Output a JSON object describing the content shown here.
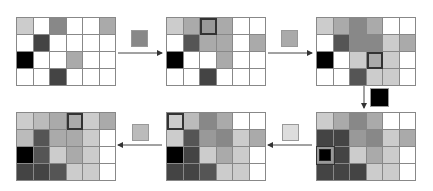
{
  "palette": {
    "W": "#ffffff",
    "L1": "#dddddd",
    "L2": "#cccccc",
    "L3": "#bbbbbb",
    "M1": "#aaaaaa",
    "M2": "#999999",
    "M3": "#888888",
    "D1": "#555555",
    "D2": "#444444",
    "K": "#000000"
  },
  "grids": [
    {
      "id": "g1",
      "cells": [
        [
          "L2",
          "W",
          "M3",
          "W",
          "W",
          "M1"
        ],
        [
          "W",
          "D2",
          "W",
          "W",
          "W",
          "W"
        ],
        [
          "K",
          "W",
          "W",
          "M1",
          "W",
          "W"
        ],
        [
          "W",
          "W",
          "D2",
          "W",
          "W",
          "W"
        ]
      ],
      "highlight": null
    },
    {
      "id": "g2",
      "cells": [
        [
          "L2",
          "M1",
          "M2",
          "M1",
          "W",
          "W"
        ],
        [
          "W",
          "D1",
          "M1",
          "M1",
          "W",
          "M1"
        ],
        [
          "K",
          "W",
          "W",
          "M1",
          "W",
          "W"
        ],
        [
          "W",
          "W",
          "D2",
          "W",
          "W",
          "W"
        ]
      ],
      "highlight": {
        "row": 0,
        "col": 2,
        "style": "dark"
      }
    },
    {
      "id": "g3",
      "cells": [
        [
          "L2",
          "M1",
          "M3",
          "M1",
          "W",
          "W"
        ],
        [
          "W",
          "D1",
          "M3",
          "M3",
          "L2",
          "M1"
        ],
        [
          "K",
          "W",
          "L2",
          "M1",
          "L2",
          "W"
        ],
        [
          "W",
          "W",
          "D1",
          "L2",
          "L2",
          "W"
        ]
      ],
      "highlight": {
        "row": 2,
        "col": 3,
        "style": "dark"
      }
    },
    {
      "id": "g4",
      "cells": [
        [
          "L2",
          "M1",
          "M3",
          "M1",
          "W",
          "W"
        ],
        [
          "D2",
          "D2",
          "M2",
          "M3",
          "L2",
          "M1"
        ],
        [
          "K",
          "D2",
          "L2",
          "M1",
          "L2",
          "W"
        ],
        [
          "D2",
          "D2",
          "D2",
          "L2",
          "L2",
          "W"
        ]
      ],
      "highlight": {
        "row": 2,
        "col": 0,
        "style": "light"
      }
    },
    {
      "id": "g5",
      "cells": [
        [
          "L2",
          "L3",
          "M3",
          "M1",
          "W",
          "W"
        ],
        [
          "L2",
          "D1",
          "M2",
          "M3",
          "L2",
          "M1"
        ],
        [
          "K",
          "D2",
          "L2",
          "M1",
          "L2",
          "W"
        ],
        [
          "D2",
          "D2",
          "D1",
          "L2",
          "L2",
          "W"
        ]
      ],
      "highlight": {
        "row": 0,
        "col": 0,
        "style": "dark"
      }
    },
    {
      "id": "g6",
      "cells": [
        [
          "L2",
          "L3",
          "M1",
          "M1",
          "L2",
          "M1"
        ],
        [
          "L3",
          "D1",
          "M1",
          "M1",
          "L2",
          "W"
        ],
        [
          "K",
          "D1",
          "L2",
          "M1",
          "L2",
          "W"
        ],
        [
          "D2",
          "D2",
          "D1",
          "L2",
          "L2",
          "W"
        ]
      ],
      "highlight": {
        "row": 0,
        "col": 3,
        "style": "dark"
      }
    }
  ],
  "swatches": [
    {
      "id": "s1",
      "color": "#888888",
      "between": "g1→g2"
    },
    {
      "id": "s2",
      "color": "#aaaaaa",
      "between": "g2→g3"
    },
    {
      "id": "s3",
      "color": "#000000",
      "between": "g3→g4"
    },
    {
      "id": "s4",
      "color": "#dddddd",
      "between": "g4→g5"
    },
    {
      "id": "s5",
      "color": "#bbbbbb",
      "between": "g5→g6"
    }
  ],
  "arrows": [
    {
      "id": "a1",
      "direction": "right",
      "from": "g1",
      "to": "g2"
    },
    {
      "id": "a2",
      "direction": "right",
      "from": "g2",
      "to": "g3"
    },
    {
      "id": "a3",
      "direction": "down",
      "from": "g3",
      "to": "g4"
    },
    {
      "id": "a4",
      "direction": "left",
      "from": "g4",
      "to": "g5"
    },
    {
      "id": "a5",
      "direction": "left",
      "from": "g5",
      "to": "g6"
    }
  ]
}
